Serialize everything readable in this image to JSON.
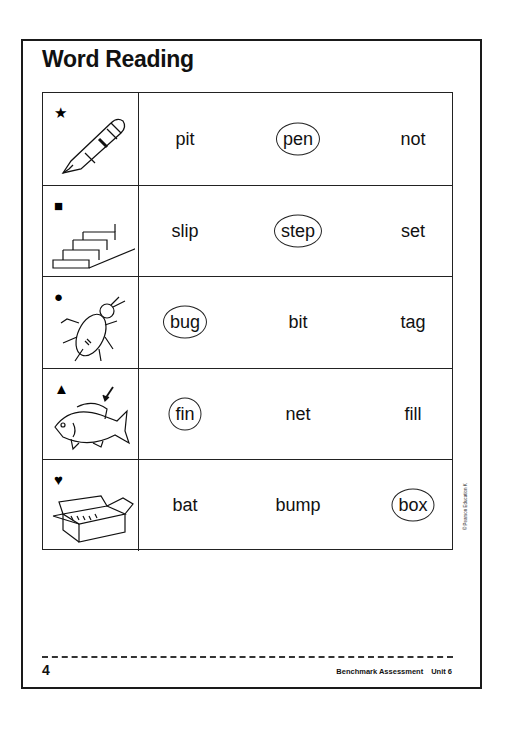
{
  "page": {
    "title": "Word Reading",
    "page_number": "4",
    "footer": {
      "assessment": "Benchmark Assessment",
      "unit": "Unit 6"
    },
    "copyright": "© Pearson Education K"
  },
  "rows": [
    {
      "shape": "★",
      "shape_name": "star",
      "picture": "pen",
      "words": [
        "pit",
        "pen",
        "not"
      ],
      "circled_index": 1
    },
    {
      "shape": "■",
      "shape_name": "square",
      "picture": "steps",
      "words": [
        "slip",
        "step",
        "set"
      ],
      "circled_index": 1
    },
    {
      "shape": "●",
      "shape_name": "circle",
      "picture": "bug",
      "words": [
        "bug",
        "bit",
        "tag"
      ],
      "circled_index": 0
    },
    {
      "shape": "▲",
      "shape_name": "triangle",
      "picture": "fish-fin",
      "words": [
        "fin",
        "net",
        "fill"
      ],
      "circled_index": 0
    },
    {
      "shape": "♥",
      "shape_name": "heart",
      "picture": "box",
      "words": [
        "bat",
        "bump",
        "box"
      ],
      "circled_index": 2
    }
  ]
}
